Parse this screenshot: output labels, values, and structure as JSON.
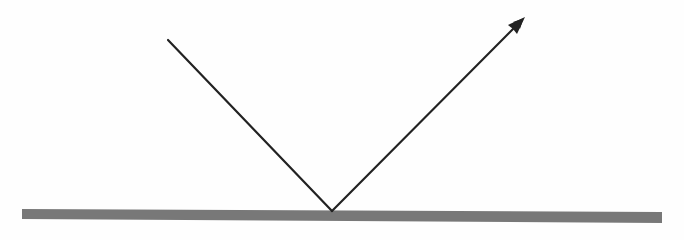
{
  "diagram": {
    "type": "reflection",
    "colors": {
      "background": "#fefefe",
      "ray": "#222222",
      "surface": "#787878"
    },
    "incident_ray": {
      "x1": 168,
      "y1": 40,
      "x2": 332,
      "y2": 211
    },
    "reflected_ray": {
      "x1": 332,
      "y1": 211,
      "x2": 524,
      "y2": 18
    },
    "surface": {
      "x1": 22,
      "x2": 662,
      "y_top_left": 209,
      "y_top_right": 212,
      "thickness": 10
    }
  }
}
